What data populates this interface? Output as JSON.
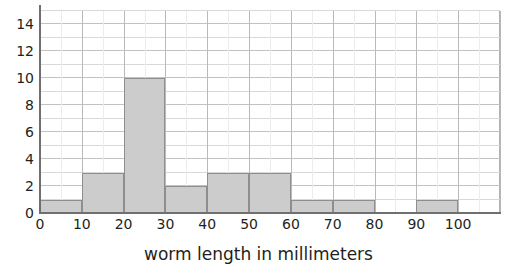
{
  "figure": {
    "title_remnant": "worm length graph",
    "xlabel": "worm length in millimeters",
    "ylabel": ""
  },
  "axis": {
    "y_ticks": [
      "14",
      "12",
      "10",
      "8",
      "6",
      "4",
      "2",
      "0"
    ],
    "x_ticks": [
      "0",
      "10",
      "20",
      "30",
      "40",
      "50",
      "60",
      "70",
      "80",
      "90",
      "100"
    ]
  },
  "colors": {
    "bar_fill": "#cccccc",
    "bar_stroke": "#8e8e8e",
    "axis": "#6f6f6f",
    "grid_major": "#c2c2c2",
    "grid_minor": "#ececec",
    "text": "#231f20",
    "background": "#ffffff"
  },
  "chart_data": {
    "type": "bar",
    "title": "",
    "xlabel": "worm length in millimeters",
    "ylabel": "",
    "categories": [
      "0-10",
      "10-20",
      "20-30",
      "30-40",
      "40-50",
      "50-60",
      "60-70",
      "70-80",
      "80-90",
      "90-100"
    ],
    "bin_edges": [
      0,
      10,
      20,
      30,
      40,
      50,
      60,
      70,
      80,
      90,
      100
    ],
    "values": [
      1,
      3,
      10,
      2,
      3,
      3,
      1,
      1,
      0,
      1
    ],
    "xlim": [
      0,
      110
    ],
    "ylim": [
      0,
      15
    ],
    "x_tick_values": [
      0,
      10,
      20,
      30,
      40,
      50,
      60,
      70,
      80,
      90,
      100
    ],
    "y_tick_values": [
      0,
      2,
      4,
      6,
      8,
      10,
      12,
      14
    ],
    "y_minor_step": 1,
    "grid": true,
    "legend": false
  }
}
